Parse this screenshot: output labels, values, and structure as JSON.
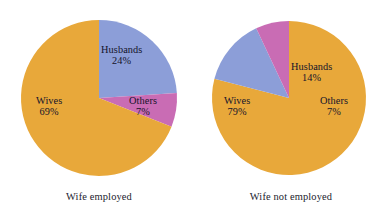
{
  "figure": {
    "background_color": "#ffffff",
    "text_color": "#14142b"
  },
  "chart_data": [
    {
      "type": "pie",
      "title": "Wife employed",
      "caption": "Wife employed",
      "categories": [
        "Husbands",
        "Others",
        "Wives"
      ],
      "values": [
        24,
        7,
        69
      ],
      "value_suffix": "%",
      "colors": [
        "#8c9ed8",
        "#c96cb4",
        "#e8a83a"
      ],
      "start_angle_deg": 0,
      "direction": "clockwise",
      "labels_inside": true,
      "legend": "none",
      "slices": [
        {
          "label": "Husbands",
          "value": 24,
          "value_text": "24%",
          "color": "#8c9ed8"
        },
        {
          "label": "Others",
          "value": 7,
          "value_text": "7%",
          "color": "#c96cb4"
        },
        {
          "label": "Wives",
          "value": 69,
          "value_text": "69%",
          "color": "#e8a83a"
        }
      ]
    },
    {
      "type": "pie",
      "title": "Wife not employed",
      "caption": "Wife not employed",
      "categories": [
        "Wives",
        "Husbands",
        "Others"
      ],
      "values": [
        79,
        14,
        7
      ],
      "value_suffix": "%",
      "colors": [
        "#e8a83a",
        "#8c9ed8",
        "#c96cb4"
      ],
      "start_angle_deg": 0,
      "direction": "clockwise",
      "labels_inside": true,
      "legend": "none",
      "slices": [
        {
          "label": "Wives",
          "value": 79,
          "value_text": "79%",
          "color": "#e8a83a"
        },
        {
          "label": "Husbands",
          "value": 14,
          "value_text": "14%",
          "color": "#8c9ed8"
        },
        {
          "label": "Others",
          "value": 7,
          "value_text": "7%",
          "color": "#c96cb4"
        }
      ]
    }
  ]
}
